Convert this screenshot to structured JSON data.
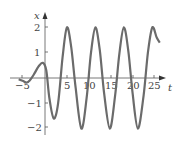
{
  "chart_data": {
    "type": "line",
    "title": "",
    "xlabel": "t",
    "ylabel": "x",
    "xlim": [
      -6,
      26.5
    ],
    "ylim": [
      -2.2,
      2.3
    ],
    "grid": false,
    "legend": null,
    "x_ticks": [
      -5,
      5,
      10,
      15,
      20,
      25
    ],
    "y_ticks": [
      -2,
      -1,
      1,
      2
    ],
    "x_tick_labels": [
      "−5",
      "5",
      "10",
      "15",
      "20",
      "25"
    ],
    "y_tick_labels": [
      "−2",
      "−1",
      "1",
      "2"
    ],
    "series": [
      {
        "name": "x(t)",
        "color": "#6b6b6b",
        "x": [
          -6,
          -5,
          -4.2,
          -3.5,
          -2.5,
          -1.5,
          -0.5,
          0.3,
          1.0,
          2.0,
          3.0,
          4.0,
          5.0,
          6.0,
          7.0,
          8.3,
          9.5,
          10.5,
          11.5,
          12.5,
          13.5,
          14.8,
          16.0,
          17.0,
          18.0,
          19.0,
          20.0,
          21.2,
          22.5,
          23.5,
          24.5,
          25.5,
          26.2
        ],
        "y": [
          -0.05,
          -0.12,
          -0.18,
          -0.1,
          0.15,
          0.45,
          0.6,
          0.3,
          -0.8,
          -1.6,
          -1.0,
          0.8,
          2.0,
          1.2,
          -0.4,
          -2.0,
          -0.8,
          1.0,
          2.0,
          1.1,
          -0.6,
          -2.0,
          -0.7,
          1.0,
          2.0,
          1.1,
          -0.6,
          -2.0,
          -0.7,
          1.0,
          2.0,
          1.6,
          1.4
        ]
      }
    ]
  }
}
